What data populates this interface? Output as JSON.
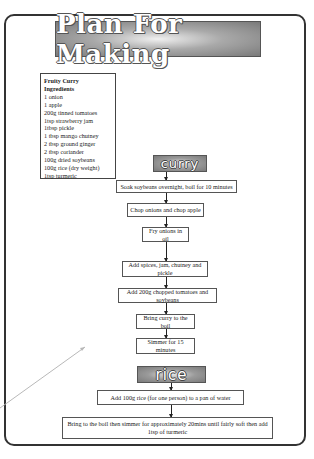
{
  "title": "Plan For Making",
  "ingredients": {
    "heading_1": "Fruity Curry",
    "heading_2": "Ingredients",
    "items": [
      "1 onion",
      "1 apple",
      "200g tinned tomatoes",
      "1tsp strawberry jam",
      "1tbsp pickle",
      "1 tbsp mango chutney",
      "2 tbsp ground ginger",
      "2 tbsp coriander",
      "100g dried soybeans",
      "100g rice (dry weight)",
      "1tsp turmeric"
    ]
  },
  "sections": {
    "curry": {
      "label": "curry",
      "steps": [
        "Soak soybeans overnight, boil for 10 minutes",
        "Chop onions and chop apple",
        "Fry onions in oil",
        "Add spices, jam, chutney and pickle",
        "Add 200g chopped tomatoes and soybeans",
        "Bring curry to the boil",
        "Simmer for 15 minutes"
      ]
    },
    "rice": {
      "label": "rice",
      "steps": [
        "Add 100g rice (for one person) to a pan of water",
        "Bring to the boil then simmer for approximately 20mins until fairly soft then add 1tsp of turmeric"
      ]
    }
  },
  "colors": {
    "border": "#333333",
    "banner_dark": "#7a7a7a",
    "banner_light": "#f0f0f0",
    "pointer_line": "#b8b8b8"
  }
}
